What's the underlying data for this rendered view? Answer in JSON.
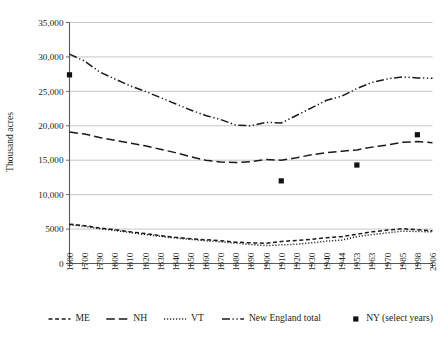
{
  "chart_data": {
    "type": "line",
    "title": "",
    "xlabel": "",
    "ylabel": "Thousand acres",
    "ylim": [
      0,
      35000
    ],
    "yticks": [
      0,
      5000,
      10000,
      15000,
      20000,
      25000,
      30000,
      35000
    ],
    "ytick_labels": [
      "0",
      "5000",
      "10,000",
      "15,000",
      "20,000",
      "25,000",
      "30,000",
      "35,000"
    ],
    "grid": true,
    "legend_position": "bottom",
    "categories": [
      "1600",
      "1700",
      "1790",
      "1800",
      "1810",
      "1820",
      "1830",
      "1840",
      "1850",
      "1860",
      "1870",
      "1880",
      "1890",
      "1900",
      "1910",
      "1920",
      "1930",
      "1940",
      "1944",
      "1953",
      "1963",
      "1970",
      "1985",
      "1998",
      "2006"
    ],
    "series": [
      {
        "name": "ME",
        "style": "short-dash",
        "values": [
          5700,
          5500,
          5150,
          4900,
          4600,
          4350,
          4050,
          3800,
          3600,
          3450,
          3300,
          3100,
          3000,
          2950,
          3200,
          3350,
          3500,
          3750,
          3900,
          4250,
          4600,
          4850,
          5050,
          4900,
          4750
        ]
      },
      {
        "name": "NH",
        "style": "long-dash",
        "values": [
          19100,
          18800,
          18300,
          17900,
          17500,
          17100,
          16600,
          16100,
          15500,
          15000,
          14750,
          14650,
          14800,
          15100,
          15000,
          15350,
          15800,
          16100,
          16300,
          16500,
          16900,
          17200,
          17600,
          17700,
          17550
        ]
      },
      {
        "name": "VT",
        "style": "dotted",
        "values": [
          5600,
          5400,
          5050,
          4800,
          4500,
          4200,
          3950,
          3700,
          3500,
          3300,
          3150,
          2950,
          2750,
          2600,
          2700,
          2800,
          3000,
          3250,
          3400,
          3900,
          4200,
          4450,
          4700,
          4650,
          4600
        ]
      },
      {
        "name": "New England total",
        "style": "dash-dot-dot",
        "values": [
          30400,
          29400,
          27800,
          26800,
          25800,
          25000,
          24100,
          23200,
          22300,
          21500,
          20900,
          20100,
          20000,
          20500,
          20400,
          21500,
          22600,
          23700,
          24300,
          25400,
          26300,
          26800,
          27100,
          26950,
          26900
        ]
      }
    ],
    "markers": {
      "name": "NY (select years)",
      "points": [
        {
          "category": "1600",
          "value": 27400
        },
        {
          "category": "1910",
          "value": 12000
        },
        {
          "category": "1953",
          "value": 14300
        },
        {
          "category": "1998",
          "value": 18700
        }
      ]
    },
    "legend": [
      {
        "label": "ME",
        "style": "short-dash"
      },
      {
        "label": "NH",
        "style": "long-dash"
      },
      {
        "label": "VT",
        "style": "dotted"
      },
      {
        "label": "New England total",
        "style": "dash-dot-dot"
      },
      {
        "label": "NY (select years)",
        "style": "square-marker"
      }
    ]
  }
}
